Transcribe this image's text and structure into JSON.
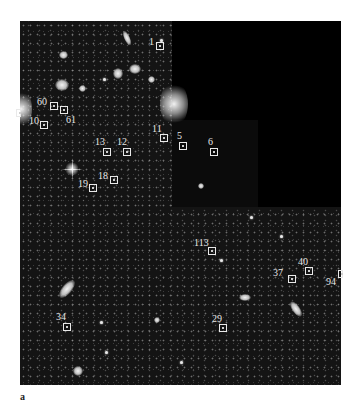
{
  "figure": {
    "panel_label": "a",
    "sources": [
      {
        "id": "1",
        "label": "1",
        "box": [
          156,
          42
        ],
        "label_pos": [
          149,
          37
        ]
      },
      {
        "id": "60",
        "label": "60",
        "box": [
          54,
          106
        ],
        "label_pos": [
          38,
          99
        ]
      },
      {
        "id": "61a",
        "label": "",
        "box": [
          64,
          110
        ],
        "label_pos": [
          0,
          0
        ]
      },
      {
        "id": "61",
        "label": "61",
        "box": [
          0,
          0
        ],
        "label_pos": [
          66,
          117
        ]
      },
      {
        "id": "10",
        "label": "10",
        "box": [
          44,
          124
        ],
        "label_pos": [
          29,
          117
        ]
      },
      {
        "id": "11",
        "label": "11",
        "box": [
          163,
          138
        ],
        "label_pos": [
          151,
          125
        ]
      },
      {
        "id": "5",
        "label": "5",
        "box": [
          183,
          146
        ],
        "label_pos": [
          177,
          133
        ]
      },
      {
        "id": "6",
        "label": "6",
        "box": [
          213,
          151
        ],
        "label_pos": [
          208,
          138
        ]
      },
      {
        "id": "13",
        "label": "13",
        "box": [
          106,
          152
        ],
        "label_pos": [
          96,
          138
        ]
      },
      {
        "id": "12",
        "label": "12",
        "box": [
          127,
          152
        ],
        "label_pos": [
          117,
          138
        ]
      },
      {
        "id": "18",
        "label": "18",
        "box": [
          114,
          180
        ],
        "label_pos": [
          98,
          172
        ]
      },
      {
        "id": "19",
        "label": "19",
        "box": [
          93,
          188
        ],
        "label_pos": [
          78,
          181
        ]
      },
      {
        "id": "113",
        "label": "113",
        "box": [
          212,
          251
        ],
        "label_pos": [
          194,
          238
        ]
      },
      {
        "id": "40",
        "label": "40",
        "box": [
          309,
          271
        ],
        "label_pos": [
          298,
          258
        ]
      },
      {
        "id": "37",
        "label": "37",
        "box": [
          292,
          279
        ],
        "label_pos": [
          273,
          268
        ]
      },
      {
        "id": "94",
        "label": "94",
        "box": [
          0,
          0
        ],
        "label_pos": [
          327,
          277
        ]
      },
      {
        "id": "29",
        "label": "29",
        "box": [
          223,
          328
        ],
        "label_pos": [
          212,
          316
        ]
      },
      {
        "id": "34",
        "label": "34",
        "box": [
          67,
          327
        ],
        "label_pos": [
          56,
          314
        ]
      }
    ]
  }
}
